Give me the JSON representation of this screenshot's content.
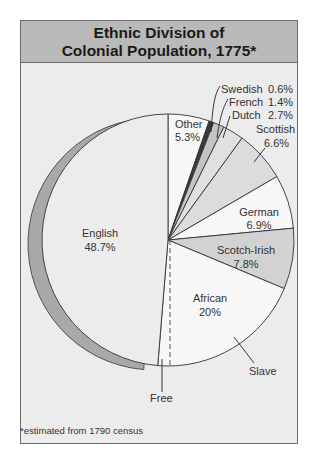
{
  "title_line1": "Ethnic Division of",
  "title_line2": "Colonial Population, 1775*",
  "footnote": "*estimated from 1790 census",
  "chart_data": {
    "type": "pie",
    "title": "Ethnic Division of Colonial Population, 1775*",
    "start_angle": "12 o'clock, clockwise",
    "slices": [
      {
        "label": "Other",
        "value": 5.3
      },
      {
        "label": "Swedish",
        "value": 0.6
      },
      {
        "label": "French",
        "value": 1.4
      },
      {
        "label": "Dutch",
        "value": 2.7
      },
      {
        "label": "Scottish",
        "value": 6.6
      },
      {
        "label": "German",
        "value": 6.9
      },
      {
        "label": "Scotch-Irish",
        "value": 7.8
      },
      {
        "label": "African",
        "value": 20,
        "subdivisions": [
          "Slave",
          "Free"
        ]
      },
      {
        "label": "English",
        "value": 48.7,
        "exploded": true
      }
    ],
    "annotations": [
      "Slave",
      "Free"
    ],
    "footnote": "*estimated from 1790 census"
  },
  "labels": {
    "other": "Other",
    "other_pct": "5.3%",
    "swedish": "Swedish",
    "swedish_pct": "0.6%",
    "french": "French",
    "french_pct": "1.4%",
    "dutch": "Dutch",
    "dutch_pct": "2.7%",
    "scottish": "Scottish",
    "scottish_pct": "6.6%",
    "german": "German",
    "german_pct": "6.9%",
    "scotch_irish": "Scotch-Irish",
    "scotch_irish_pct": "7.8%",
    "african": "African",
    "african_pct": "20%",
    "english": "English",
    "english_pct": "48.7%",
    "slave": "Slave",
    "free": "Free"
  }
}
